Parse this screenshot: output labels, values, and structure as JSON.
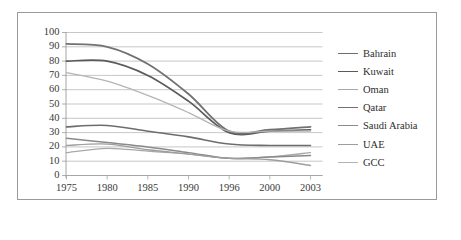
{
  "chart_data": {
    "type": "line",
    "title": "",
    "xlabel": "",
    "ylabel": "",
    "categories": [
      "1975",
      "1980",
      "1985",
      "1990",
      "1996",
      "2000",
      "2003"
    ],
    "ylim": [
      0,
      100
    ],
    "yticks": [
      0,
      10,
      20,
      30,
      40,
      50,
      60,
      70,
      80,
      90,
      100
    ],
    "grid": true,
    "legend_position": "right",
    "series": [
      {
        "name": "Bahrain",
        "color": "#6d6d6d",
        "width": 1.6,
        "values": [
          34,
          35,
          31,
          27,
          22,
          21,
          21
        ]
      },
      {
        "name": "Kuwait",
        "color": "#5a5a5a",
        "width": 1.7,
        "values": [
          80,
          80,
          70,
          52,
          30,
          31,
          32
        ]
      },
      {
        "name": "Oman",
        "color": "#a8a8a8",
        "width": 1.3,
        "values": [
          16,
          19,
          17,
          15,
          12,
          13,
          16
        ]
      },
      {
        "name": "Qatar",
        "color": "#717171",
        "width": 1.8,
        "values": [
          92,
          90,
          78,
          57,
          31,
          32,
          34
        ]
      },
      {
        "name": "Saudi Arabia",
        "color": "#8a8a8a",
        "width": 1.5,
        "values": [
          26,
          23,
          20,
          16,
          12,
          13,
          14
        ]
      },
      {
        "name": "UAE",
        "color": "#9d9d9d",
        "width": 1.3,
        "values": [
          21,
          22,
          18,
          15,
          12,
          11,
          7
        ]
      },
      {
        "name": "GCC",
        "color": "#b4b4b4",
        "width": 1.2,
        "values": [
          72,
          66,
          56,
          44,
          31,
          31,
          31
        ]
      }
    ]
  },
  "axis": {
    "y_tick_labels": [
      "100",
      "90",
      "80",
      "70",
      "60",
      "50",
      "40",
      "30",
      "20",
      "10",
      "0"
    ],
    "x_tick_labels": [
      "1975",
      "1980",
      "1985",
      "1990",
      "1996",
      "2000",
      "2003"
    ]
  }
}
